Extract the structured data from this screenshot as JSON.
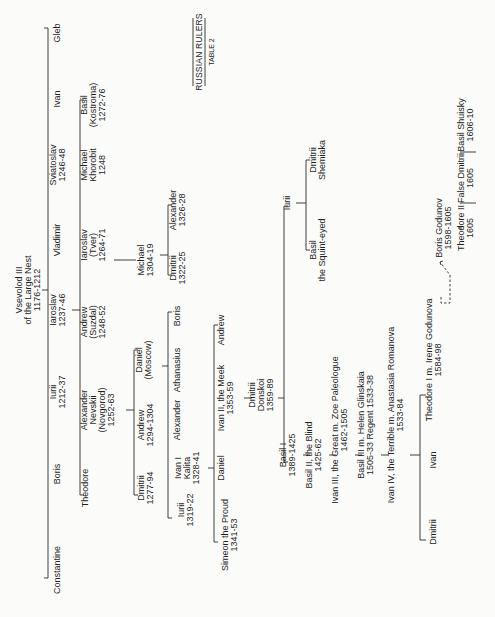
{
  "title": "RUSSIAN RULERS",
  "subtitle": "TABLE 2",
  "root": {
    "lines": [
      "Vsevolod III",
      "of the Large Nest",
      "1176-1212"
    ]
  },
  "nodes": [
    {
      "id": "gleb",
      "lines": [
        "Gleb"
      ],
      "x": 60,
      "y": 33
    },
    {
      "id": "ivan_g1",
      "lines": [
        "Ivan"
      ],
      "x": 60,
      "y": 99
    },
    {
      "id": "sviatoslav",
      "lines": [
        "Sviatoslav",
        "1246-48"
      ],
      "x": 60,
      "y": 165
    },
    {
      "id": "vladimir",
      "lines": [
        "Vladimir"
      ],
      "x": 60,
      "y": 240
    },
    {
      "id": "iaroslav",
      "lines": [
        "Iaroslav",
        "1237-46"
      ],
      "x": 60,
      "y": 310
    },
    {
      "id": "iurii_g1",
      "lines": [
        "Iurii",
        "1212-37"
      ],
      "x": 60,
      "y": 392
    },
    {
      "id": "boris_g1",
      "lines": [
        "Boris"
      ],
      "x": 60,
      "y": 474
    },
    {
      "id": "constantine",
      "lines": [
        "Constantine"
      ],
      "x": 60,
      "y": 570
    },
    {
      "id": "basil_kostroma",
      "lines": [
        "Basil",
        "(Kostroma)",
        "1272-76"
      ],
      "x": 96,
      "y": 105
    },
    {
      "id": "michael_khorobit",
      "lines": [
        "Michael",
        "Khorobit",
        "1248"
      ],
      "x": 96,
      "y": 165
    },
    {
      "id": "iaroslav_tver",
      "lines": [
        "Iaroslav",
        "(Tver)",
        "1264-71"
      ],
      "x": 96,
      "y": 245
    },
    {
      "id": "andrew_suzdal",
      "lines": [
        "Andrew",
        "(Suzdal)",
        "1248-52"
      ],
      "x": 96,
      "y": 322
    },
    {
      "id": "alexander_nevskii",
      "lines": [
        "Alexander",
        "Nevskii",
        "(Novgorod)",
        "1252-63"
      ],
      "x": 100,
      "y": 410
    },
    {
      "id": "theodore_g2",
      "lines": [
        "Theodore"
      ],
      "x": 88,
      "y": 488
    },
    {
      "id": "michael_tver",
      "lines": [
        "Michael",
        "1304-19"
      ],
      "x": 148,
      "y": 260
    },
    {
      "id": "alexander_1326",
      "lines": [
        "Alexander",
        "1326-28"
      ],
      "x": 180,
      "y": 210
    },
    {
      "id": "dmitrii_1322",
      "lines": [
        "Dmitrii",
        "1322-25"
      ],
      "x": 180,
      "y": 268
    },
    {
      "id": "daniel_moscow",
      "lines": [
        "Daniel",
        "(Moscow)"
      ],
      "x": 146,
      "y": 360
    },
    {
      "id": "andrew_1294",
      "lines": [
        "Andrew",
        "1294-1304"
      ],
      "x": 148,
      "y": 425
    },
    {
      "id": "dmitrii_1277",
      "lines": [
        "Dmitrii",
        "1277-94"
      ],
      "x": 148,
      "y": 488
    },
    {
      "id": "boris_g4",
      "lines": [
        "Boris"
      ],
      "x": 180,
      "y": 316
    },
    {
      "id": "athanasius",
      "lines": [
        "Athanasius"
      ],
      "x": 180,
      "y": 370
    },
    {
      "id": "alexander_g4",
      "lines": [
        "Alexander"
      ],
      "x": 180,
      "y": 420
    },
    {
      "id": "ivan_kalita",
      "lines": [
        "Ivan I",
        "Kalita",
        "1328-41"
      ],
      "x": 190,
      "y": 468
    },
    {
      "id": "iurii_1319",
      "lines": [
        "Iurii",
        "1319-22"
      ],
      "x": 188,
      "y": 510
    },
    {
      "id": "andrew_g5",
      "lines": [
        "Andrew"
      ],
      "x": 224,
      "y": 330
    },
    {
      "id": "ivan_meek",
      "lines": [
        "Ivan II, the Meek",
        "1353-59"
      ],
      "x": 228,
      "y": 398
    },
    {
      "id": "daniel_g5",
      "lines": [
        "Daniel"
      ],
      "x": 224,
      "y": 468
    },
    {
      "id": "simeon",
      "lines": [
        "Simeon the Proud",
        "1341-53"
      ],
      "x": 232,
      "y": 535
    },
    {
      "id": "dmitrii_donskoi",
      "lines": [
        "Dmitrii",
        "Donskoi",
        "1359-89"
      ],
      "x": 264,
      "y": 395
    },
    {
      "id": "iurii_g7",
      "lines": [
        "Iurii"
      ],
      "x": 290,
      "y": 203
    },
    {
      "id": "dmitrii_shemiaka",
      "lines": [
        "Dmitrii",
        "Shemiaka"
      ],
      "x": 320,
      "y": 160
    },
    {
      "id": "basil_squint",
      "lines": [
        "Basil",
        "the Squint-eyed"
      ],
      "x": 320,
      "y": 250
    },
    {
      "id": "basil_1",
      "lines": [
        "Basil I",
        "1389-1425"
      ],
      "x": 290,
      "y": 455
    },
    {
      "id": "basil_2",
      "lines": [
        "Basil II, the Blind",
        "1425-62"
      ],
      "x": 316,
      "y": 455
    },
    {
      "id": "ivan_3",
      "lines": [
        "Ivan III, the Great  m. Zoe Paleologue",
        "1462-1505"
      ],
      "x": 342,
      "y": 430
    },
    {
      "id": "basil_3",
      "lines": [
        "Basil III  m. Helen Glinskaia",
        "1505-33        Regent 1533-38"
      ],
      "x": 368,
      "y": 425
    },
    {
      "id": "ivan_4",
      "lines": [
        "Ivan IV, the Terrible  m. Anastasia Romanova",
        "1533-84"
      ],
      "x": 398,
      "y": 415
    },
    {
      "id": "theodore_1",
      "lines": [
        "Theodore I  m. Irene Godunova",
        "1584-98"
      ],
      "x": 436,
      "y": 360
    },
    {
      "id": "ivan_g12",
      "lines": [
        "Ivan"
      ],
      "x": 436,
      "y": 460
    },
    {
      "id": "dmitrii_g12",
      "lines": [
        "Dmitrii"
      ],
      "x": 436,
      "y": 532
    },
    {
      "id": "boris_godunov",
      "lines": [
        "Boris Godunov",
        "1598-1605"
      ],
      "x": 446,
      "y": 228
    },
    {
      "id": "theodore_2",
      "lines": [
        "Theodore II",
        "1605"
      ],
      "x": 468,
      "y": 228
    },
    {
      "id": "false_dmitrii",
      "lines": [
        "False Dmitrii",
        "1605"
      ],
      "x": 468,
      "y": 178
    },
    {
      "id": "basil_shuisky",
      "lines": [
        "Basil Shuisky",
        "1606-10"
      ],
      "x": 468,
      "y": 125
    }
  ]
}
